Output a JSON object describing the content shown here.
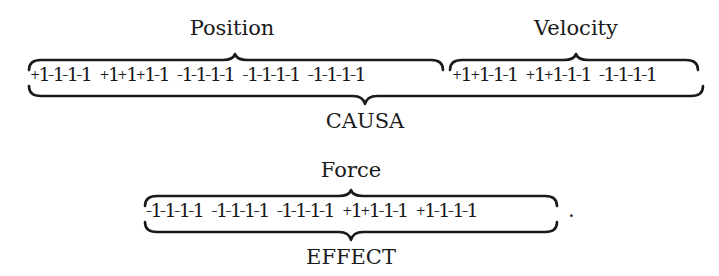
{
  "equation": {
    "top": {
      "blocks": [
        {
          "label": "Position",
          "groups": [
            [
              "+1",
              "-1",
              "-1",
              "-1"
            ],
            [
              "+1",
              "+1",
              "+1",
              "-1"
            ],
            [
              "-1",
              "-1",
              "-1",
              "-1"
            ],
            [
              "-1",
              "-1",
              "-1",
              "-1"
            ],
            [
              "-1",
              "-1",
              "-1",
              "-1"
            ]
          ]
        },
        {
          "label": "Velocity",
          "groups": [
            [
              "+1",
              "+1",
              "-1",
              "-1"
            ],
            [
              "+1",
              "+1",
              "-1",
              "-1"
            ],
            [
              "-1",
              "-1",
              "-1",
              "-1"
            ]
          ]
        }
      ],
      "under_label": "CAUSA"
    },
    "bottom": {
      "blocks": [
        {
          "label": "Force",
          "groups": [
            [
              "-1",
              "-1",
              "-1",
              "-1"
            ],
            [
              "-1",
              "-1",
              "-1",
              "-1"
            ],
            [
              "-1",
              "-1",
              "-1",
              "-1"
            ],
            [
              "+1",
              "+1",
              "-1",
              "-1"
            ],
            [
              "+1",
              "-1",
              "-1",
              "-1"
            ]
          ]
        }
      ],
      "under_label": "EFFECT",
      "trailing": "."
    }
  }
}
